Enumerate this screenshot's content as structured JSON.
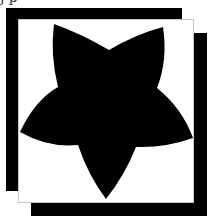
{
  "caption": {
    "text": "j                p"
  },
  "colors": {
    "frame": "#000000",
    "card_background": "#ffffff",
    "card_border": "#c8c8c8",
    "star_fill": "#000000"
  },
  "icon": {
    "name": "star-icon",
    "orientation": "inverted"
  }
}
